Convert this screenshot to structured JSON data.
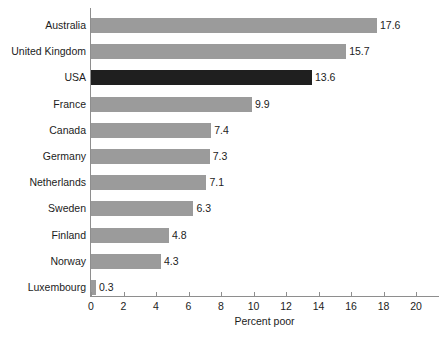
{
  "chart_data": {
    "type": "bar",
    "orientation": "horizontal",
    "title": "",
    "xlabel": "Percent poor",
    "ylabel": "",
    "xlim": [
      0,
      20
    ],
    "xticks": [
      0,
      2,
      4,
      6,
      8,
      10,
      12,
      14,
      16,
      18,
      20
    ],
    "xtick_labels": [
      "0",
      "2",
      "4",
      "6",
      "8",
      "10",
      "12",
      "14",
      "16",
      "18",
      "20"
    ],
    "grid": false,
    "legend": false,
    "categories": [
      "Australia",
      "United Kingdom",
      "USA",
      "France",
      "Canada",
      "Germany",
      "Netherlands",
      "Sweden",
      "Finland",
      "Norway",
      "Luxembourg"
    ],
    "values": [
      17.6,
      15.7,
      13.6,
      9.9,
      7.4,
      7.3,
      7.1,
      6.3,
      4.8,
      4.3,
      0.3
    ],
    "value_labels": [
      "17.6",
      "15.7",
      "13.6",
      "9.9",
      "7.4",
      "7.3",
      "7.1",
      "6.3",
      "4.8",
      "4.3",
      "0.3"
    ],
    "highlighted_category": "USA",
    "colors": {
      "bar": "#9b9b9b",
      "bar_highlight": "#1f1f1f",
      "axis": "#8e8e8e",
      "text": "#1c1c1c",
      "background": "#ffffff"
    }
  }
}
